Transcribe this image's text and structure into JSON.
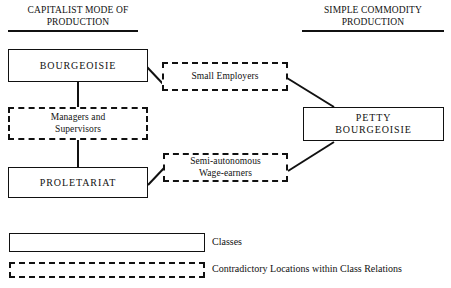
{
  "diagram": {
    "title_left": {
      "line1": "CAPITALIST MODE OF",
      "line2": "PRODUCTION"
    },
    "title_right": {
      "line1": "SIMPLE COMMODITY",
      "line2": "PRODUCTION"
    },
    "nodes": {
      "bourgeoisie": "BOURGEOISIE",
      "small_employers": "Small Employers",
      "managers": "Managers and\nSupervisors",
      "managers_line1": "Managers and",
      "managers_line2": "Supervisors",
      "proletariat": "PROLETARIAT",
      "semi_autonomous_line1": "Semi-autonomous",
      "semi_autonomous_line2": "Wage-earners",
      "petty_line1": "PETTY",
      "petty_line2": "BOURGEOISIE"
    },
    "legend": {
      "classes": "Classes",
      "contradictory": "Contradictory Locations within Class Relations"
    },
    "colors": {
      "ink": "#111111",
      "background": "#ffffff"
    }
  }
}
